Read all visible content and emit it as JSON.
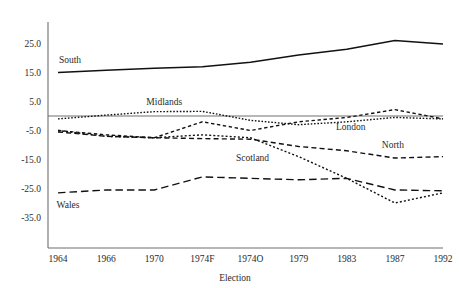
{
  "chart_data": {
    "type": "line",
    "title": "",
    "xlabel": "Election",
    "ylabel": "",
    "categories": [
      "1964",
      "1966",
      "1970",
      "1974F",
      "1974O",
      "1979",
      "1983",
      "1987",
      "1992"
    ],
    "ylim": [
      -35.0,
      30.0
    ],
    "yticks": [
      25.0,
      15.0,
      5.0,
      -5.0,
      -15.0,
      -25.0,
      -35.0
    ],
    "ytick_labels": [
      "25.0",
      "15.0",
      "5.0",
      "-5.0",
      "-15.0",
      "-25.0",
      "-35.0"
    ],
    "grid": false,
    "legend": "inline-labels",
    "zero_reference_line": true,
    "line_color": "#111111",
    "series": [
      {
        "name": "South",
        "style": "solid",
        "values": [
          15.0,
          15.8,
          16.5,
          17.0,
          18.5,
          21.0,
          23.0,
          26.0,
          24.8
        ],
        "label_x_category": "1964",
        "label_value": 19.5
      },
      {
        "name": "Midlands",
        "style": "dotted",
        "values": [
          -1.0,
          0.3,
          1.5,
          1.6,
          -1.5,
          -3.0,
          -2.0,
          -0.5,
          -1.0
        ],
        "label_x_category": "1970",
        "label_value": 5.0
      },
      {
        "name": "London",
        "style": "dashed-fine",
        "values": [
          -5.0,
          -6.5,
          -7.5,
          -2.0,
          -5.0,
          -2.0,
          -0.5,
          2.2,
          -1.0
        ],
        "label_x_category": "1983",
        "label_value": -3.5
      },
      {
        "name": "North",
        "style": "dashed",
        "values": [
          -5.5,
          -7.0,
          -7.5,
          -7.8,
          -8.0,
          -10.5,
          -12.0,
          -14.5,
          -14.0
        ],
        "label_x_category": "1987",
        "label_value": -10.0
      },
      {
        "name": "Scotland",
        "style": "dotted-fine",
        "values": [
          -5.0,
          -7.0,
          -7.5,
          -6.5,
          -7.5,
          -14.0,
          -21.5,
          -30.0,
          -26.5
        ],
        "label_x_category": "1974O",
        "label_value": -14.5
      },
      {
        "name": "Wales",
        "style": "dashed-long",
        "values": [
          -26.5,
          -25.5,
          -25.5,
          -21.0,
          -21.5,
          -22.0,
          -21.5,
          -25.5,
          -25.8
        ],
        "label_x_category": "1964",
        "label_value": -30.5
      }
    ]
  }
}
